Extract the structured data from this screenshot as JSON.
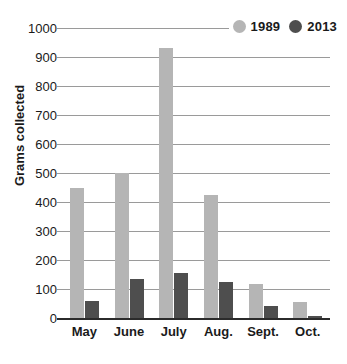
{
  "chart_data": {
    "type": "bar",
    "title": "",
    "subtitle": "",
    "xlabel": "",
    "ylabel": "Grams collected",
    "categories": [
      "May",
      "June",
      "July",
      "Aug.",
      "Sept.",
      "Oct."
    ],
    "series": [
      {
        "name": "1989",
        "color": "#b5b5b5",
        "values": [
          450,
          500,
          930,
          425,
          118,
          55
        ]
      },
      {
        "name": "2013",
        "color": "#4e4e4e",
        "values": [
          60,
          135,
          155,
          125,
          40,
          8
        ]
      }
    ],
    "ylim": [
      0,
      1000
    ],
    "ytick_values": [
      0,
      100,
      200,
      300,
      400,
      500,
      600,
      700,
      800,
      900,
      1000
    ],
    "ytick_labels": [
      "0",
      "100",
      "200",
      "300",
      "400",
      "500",
      "600",
      "700",
      "800",
      "900",
      "1000"
    ],
    "grid": true,
    "grid_axis": "y",
    "legend_position": "top-right",
    "legend_marker": "circle"
  },
  "legend": {
    "entries": [
      {
        "label": "1989",
        "swatch_name": "legend-swatch-1989"
      },
      {
        "label": "2013",
        "swatch_name": "legend-swatch-2013"
      }
    ]
  },
  "colors": {
    "series_1989": "#b5b5b5",
    "series_2013": "#4e4e4e",
    "gridline": "#9a9a9a",
    "axis": "#2b2b2b",
    "text": "#1a1a1a",
    "background": "#ffffff"
  }
}
